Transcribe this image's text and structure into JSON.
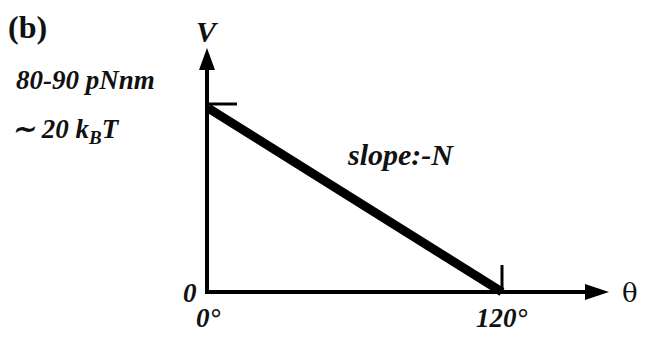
{
  "panel_label": "(b)",
  "y_axis_label": "V",
  "x_axis_label": "θ",
  "origin_label": "0",
  "y_value_line1": "80-90 pNnm",
  "y_value_line2_prefix": "∼  20 k",
  "y_value_line2_sub": "B",
  "y_value_line2_suffix": "T",
  "x_tick_start": "0°",
  "x_tick_end": "120°",
  "slope_label": "slope:-N",
  "colors": {
    "line": "#000000",
    "background": "#ffffff"
  }
}
